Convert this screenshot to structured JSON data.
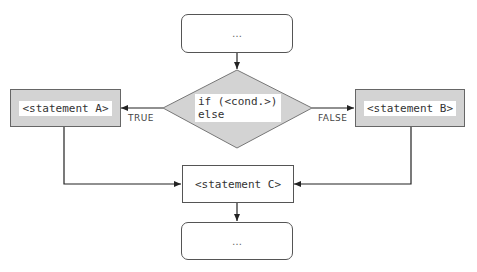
{
  "diagram": {
    "type": "flowchart",
    "nodes": {
      "start": {
        "label": "…",
        "shape": "rounded-rect"
      },
      "decision": {
        "label": "if (<cond.>) else",
        "shape": "diamond"
      },
      "statement_a": {
        "label": "<statement A>",
        "shape": "rect"
      },
      "statement_b": {
        "label": "<statement B>",
        "shape": "rect"
      },
      "statement_c": {
        "label": "<statement C>",
        "shape": "rect"
      },
      "end": {
        "label": "…",
        "shape": "rounded-rect"
      }
    },
    "edges": [
      {
        "from": "start",
        "to": "decision",
        "label": ""
      },
      {
        "from": "decision",
        "to": "statement_a",
        "label": "TRUE"
      },
      {
        "from": "decision",
        "to": "statement_b",
        "label": "FALSE"
      },
      {
        "from": "statement_a",
        "to": "statement_c",
        "label": ""
      },
      {
        "from": "statement_b",
        "to": "statement_c",
        "label": ""
      },
      {
        "from": "statement_c",
        "to": "end",
        "label": ""
      }
    ],
    "edge_labels": {
      "true": "TRUE",
      "false": "FALSE"
    },
    "colors": {
      "node_fill_grey": "#d3d3d3",
      "node_fill_white": "#ffffff",
      "stroke": "#555555",
      "text": "#333333"
    }
  }
}
